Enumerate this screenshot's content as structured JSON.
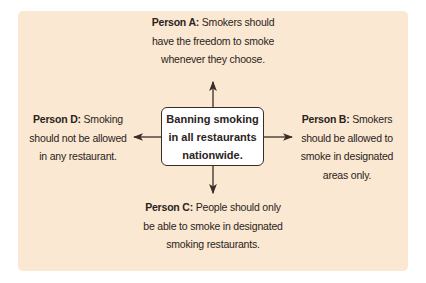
{
  "center": {
    "lines": [
      "Banning smoking",
      "in all restaurants",
      "nationwide."
    ]
  },
  "positions": [
    {
      "id": "A",
      "label": "Person A:",
      "lines": [
        " Smokers should",
        "have the freedom to smoke",
        "whenever they choose."
      ]
    },
    {
      "id": "B",
      "label": "Person B:",
      "lines": [
        " Smokers",
        "should be allowed to",
        "smoke in designated",
        "areas only."
      ]
    },
    {
      "id": "C",
      "label": "Person C:",
      "lines": [
        " People should only",
        "be able to smoke in designated",
        "smoking restaurants."
      ]
    },
    {
      "id": "D",
      "label": "Person D:",
      "lines": [
        " Smoking",
        "should not be allowed",
        "in any restaurant."
      ]
    }
  ],
  "colors": {
    "panel": "#fae8d2",
    "box_fill": "#ffffff",
    "ink": "#2a2320"
  }
}
